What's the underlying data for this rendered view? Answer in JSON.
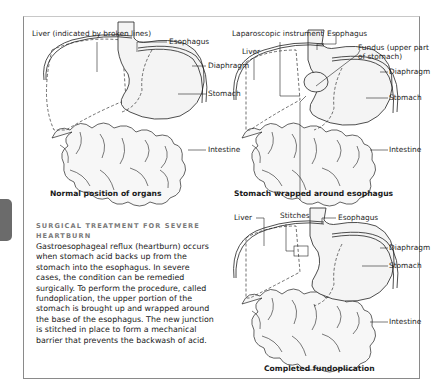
{
  "panels": [
    {
      "id": "normal",
      "caption": "Normal position of organs",
      "labels": {
        "liver": "Liver (indicated by broken lines)",
        "esophagus": "Esophagus",
        "diaphragm": "Diaphragm",
        "stomach": "Stomach",
        "intestine": "Intestine"
      }
    },
    {
      "id": "wrapped",
      "caption": "Stomach wrapped around esophagus",
      "labels": {
        "instrument": "Laparoscopic instrument",
        "esophagus": "Esophagus",
        "liver": "Liver",
        "fundus_line1": "Fundus (upper part",
        "fundus_line2": "of stomach)",
        "diaphragm": "Diaphragm",
        "stomach": "Stomach",
        "intestine": "Intestine"
      }
    },
    {
      "id": "completed",
      "caption": "Completed fundoplication",
      "labels": {
        "liver": "Liver",
        "stitches": "Stitches",
        "esophagus": "Esophagus",
        "diaphragm": "Diaphragm",
        "stomach": "Stomach",
        "intestine": "Intestine"
      }
    }
  ],
  "sidebar": {
    "heading_line1": "Surgical treatment for severe",
    "heading_line2": "heartburn",
    "body": "Gastroesophageal reflux (heartburn) occurs when stomach acid backs up from the stomach into the esophagus. In severe cases, the condition can be remedied surgically. To perform the procedure, called fundoplication, the upper portion of the stomach is brought up and wrapped around the base of the esophagus. The new junction is stitched in place to form a mechanical barrier that prevents the backwash of acid."
  },
  "colors": {
    "frame": "#8a8a8a",
    "tab": "#6b6b6b",
    "heading": "#7a7a7a",
    "text": "#1a1a1a"
  }
}
